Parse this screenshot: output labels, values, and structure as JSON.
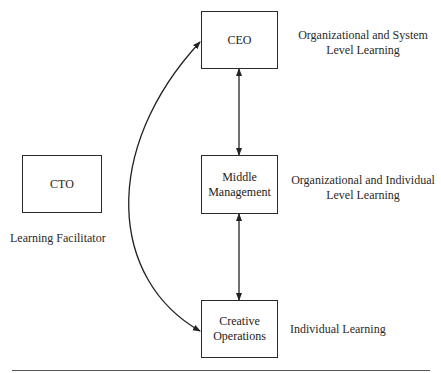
{
  "diagram": {
    "nodes": [
      {
        "id": "ceo",
        "label": "CEO"
      },
      {
        "id": "middle",
        "label": "Middle Management"
      },
      {
        "id": "creative",
        "label": "Creative Operations"
      },
      {
        "id": "cto",
        "label": "CTO"
      }
    ],
    "annotations": {
      "ceo": {
        "line1": "Organizational and System",
        "line2": "Level Learning"
      },
      "middle": {
        "line1": "Organizational and Individual",
        "line2": "Level Learning"
      },
      "creative": {
        "line1": "Individual Learning"
      },
      "cto": {
        "line1": "Learning Facilitator"
      }
    },
    "node_text": {
      "ceo": "CEO",
      "middle_line1": "Middle",
      "middle_line2": "Management",
      "creative_line1": "Creative",
      "creative_line2": "Operations",
      "cto": "CTO"
    },
    "edges": [
      {
        "from": "ceo",
        "to": "middle",
        "type": "bidirectional"
      },
      {
        "from": "middle",
        "to": "creative",
        "type": "bidirectional"
      },
      {
        "from": "creative",
        "to": "ceo",
        "type": "curved-bidirectional"
      }
    ]
  }
}
